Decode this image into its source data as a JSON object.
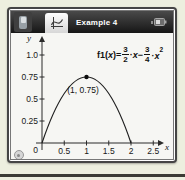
{
  "titlebar": {
    "title": "Example 4",
    "icons": {
      "left_button": "handheld-icon",
      "tab": "graphs-app-icon",
      "right": "battery-icon"
    }
  },
  "equation": {
    "f_name": "f1",
    "open": "(",
    "variable": "x",
    "close": ")=",
    "frac1_num": "3",
    "frac1_den": "2",
    "dot1": "·",
    "x1": "x",
    "minus": "−",
    "frac2_num": "3",
    "frac2_den": "4",
    "dot2": "·",
    "x2": "x",
    "power": "2"
  },
  "plot": {
    "point_label": "(1, 0.75)",
    "origin_label": "0",
    "x_axis_letter": "x",
    "y_axis_letter": "y",
    "x_tick_labels": [
      "0.5",
      "1",
      "1.5",
      "2",
      "2.5"
    ],
    "y_tick_labels": [
      "1.0",
      "0.75",
      "0.5",
      "0.25"
    ],
    "corner_icon": "cursor-circle-icon"
  },
  "colors": {
    "titlebar": "#2e2e2e",
    "page_background": "#edefdf",
    "plot_background": "#f6f6f3",
    "ink": "#111111"
  },
  "chart_data": {
    "type": "line",
    "title": "",
    "function_label": "f1(x)= 3/2·x − 3/4·x²",
    "function": "f1(x) = (3/2)x - (3/4)x^2",
    "xlabel": "x",
    "ylabel": "y",
    "x_ticks": [
      0.5,
      1,
      1.5,
      2,
      2.5
    ],
    "y_ticks": [
      1.0,
      0.75,
      0.5,
      0.25
    ],
    "xlim": [
      -0.3,
      2.9
    ],
    "ylim": [
      -0.3,
      1.2
    ],
    "grid": false,
    "roots": [
      0,
      2
    ],
    "vertex": {
      "x": 1,
      "y": 0.75
    },
    "marked_point": {
      "x": 1,
      "y": 0.75,
      "label": "(1, 0.75)"
    },
    "series": [
      {
        "name": "f1",
        "x": [
          0,
          0.25,
          0.5,
          0.75,
          1,
          1.25,
          1.5,
          1.75,
          2
        ],
        "y": [
          0,
          0.33,
          0.56,
          0.7,
          0.75,
          0.7,
          0.56,
          0.33,
          0
        ]
      }
    ],
    "legend_position": "none"
  }
}
